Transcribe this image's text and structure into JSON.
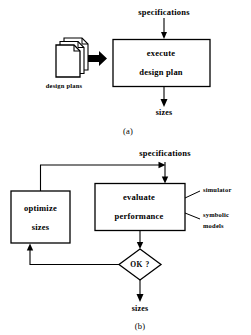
{
  "figure": {
    "background_color": "#ffffff",
    "ink_color": "#000000",
    "panels": [
      {
        "id": "a",
        "caption": "(a)",
        "input_label": "specifications",
        "source_stack": {
          "icon": "document-stack-icon",
          "label": "design plans",
          "sheets": 3
        },
        "flow_arrow": {
          "style": "thick-block-arrow",
          "direction": "right"
        },
        "process_box": {
          "lines": [
            "execute",
            "design plan"
          ]
        },
        "output_label": "sizes"
      },
      {
        "id": "b",
        "caption": "(b)",
        "input_label": "specifications",
        "optimize_box": {
          "lines": [
            "optimize",
            "sizes"
          ]
        },
        "evaluate_box": {
          "lines": [
            "evaluate",
            "performance"
          ]
        },
        "annotations": [
          {
            "label": "simulator"
          },
          {
            "label": "symbolic models",
            "lines": [
              "symbolic",
              "models"
            ]
          }
        ],
        "decision": {
          "label": "OK ?",
          "shape": "diamond"
        },
        "output_label": "sizes",
        "feedback_loop": {
          "from": "decision",
          "to": "optimize_box",
          "description": "no-branch returns to optimize sizes"
        },
        "recycle_loop": {
          "from": "optimize_box",
          "to": "evaluate_box",
          "description": "optimized sizes re-enter evaluate performance"
        }
      }
    ]
  }
}
